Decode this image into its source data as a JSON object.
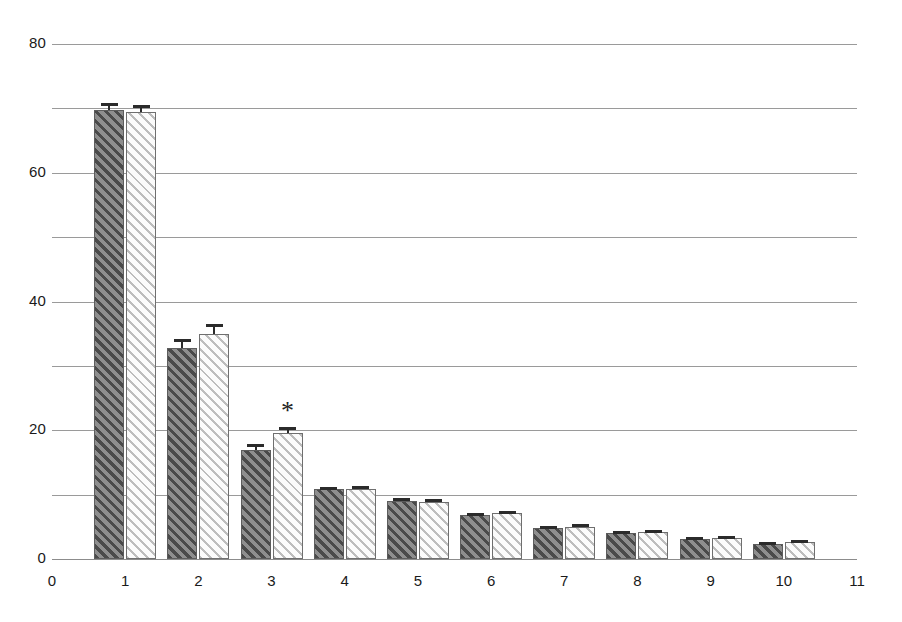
{
  "chart_data": {
    "type": "bar",
    "title": "",
    "subtitle": "",
    "xlabel": "",
    "ylabel": "",
    "categories": [
      "1",
      "2",
      "3",
      "4",
      "5",
      "6",
      "7",
      "8",
      "9",
      "10"
    ],
    "x_tick_labels": [
      "0",
      "1",
      "2",
      "3",
      "4",
      "5",
      "6",
      "7",
      "8",
      "9",
      "10",
      "11"
    ],
    "y_tick_labels": [
      "0",
      "20",
      "40",
      "60",
      "80"
    ],
    "y_tick_values": [
      0,
      20,
      40,
      60,
      80
    ],
    "gridline_values": [
      10,
      20,
      30,
      40,
      50,
      60,
      70,
      80
    ],
    "xlim": [
      0,
      11
    ],
    "ylim": [
      0,
      80
    ],
    "grid": true,
    "legend": false,
    "legend_position": "none",
    "series": [
      {
        "name": "dark-hatched",
        "fill": "dark-diagonal-hatch",
        "color": "#7b7b7b",
        "values": [
          69.8,
          32.8,
          17.0,
          10.8,
          9.0,
          6.8,
          4.8,
          4.1,
          3.1,
          2.4
        ],
        "errors": [
          1.0,
          1.3,
          0.9,
          0.4,
          0.4,
          0.4,
          0.3,
          0.3,
          0.3,
          0.3
        ]
      },
      {
        "name": "light-hatched",
        "fill": "light-diagonal-hatch",
        "color": "#f4f4f4",
        "values": [
          69.5,
          34.9,
          19.5,
          10.9,
          8.9,
          7.1,
          5.0,
          4.2,
          3.3,
          2.6
        ],
        "errors": [
          1.0,
          1.6,
          1.0,
          0.4,
          0.4,
          0.4,
          0.4,
          0.3,
          0.3,
          0.3
        ]
      }
    ],
    "annotations": [
      {
        "text": "*",
        "x_category": "3",
        "series": "light-hatched",
        "y": 23.0
      }
    ]
  },
  "colors": {
    "grid": "#9a9a9a",
    "axis": "#8c8c8c",
    "text": "#1a1a1a",
    "error_bar": "#2b2b2b",
    "bar_dark": "#7b7b7b",
    "bar_light": "#f4f4f4"
  }
}
